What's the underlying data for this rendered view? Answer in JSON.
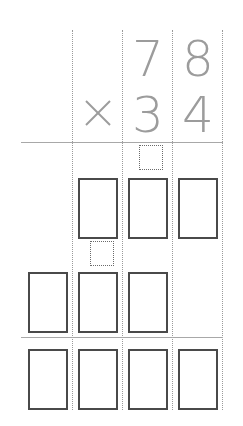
{
  "problem": {
    "multiplicand": [
      "7",
      "8"
    ],
    "multiplier": [
      "3",
      "4"
    ],
    "operator": "×"
  },
  "layout": {
    "columns": 4,
    "partial_product_1_boxes": 3,
    "partial_product_2_boxes": 3,
    "final_product_boxes": 4,
    "carry_boxes": 2
  },
  "colors": {
    "digit": "#9c9c9c",
    "box_border": "#4a4a4a",
    "grid_line": "#9a9a9a"
  }
}
